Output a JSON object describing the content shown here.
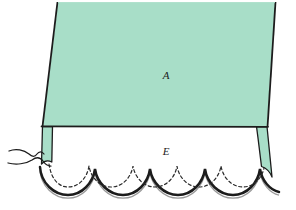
{
  "figure": {
    "background_color": "#ffffff",
    "panels": [
      {
        "id": "A",
        "label": "A",
        "name": "main-panel",
        "fill_color": "#a8dec8",
        "stroke_color": "#1c1c1c",
        "label_x": 166,
        "label_y": 75,
        "description": "Main fabric panel, mint green, trapezoid tapering downward"
      },
      {
        "id": "E",
        "label": "E",
        "name": "scalloped-facing-panel",
        "fill_color": "#ffffff",
        "stroke_color": "#1c1c1c",
        "label_x": 166,
        "label_y": 152,
        "description": "White scalloped hem facing below seam line"
      }
    ],
    "side_tabs": {
      "name": "side-seam-tabs",
      "fill_color": "#a8dec8",
      "count": 2,
      "description": "Green side seam allowance tabs extending below the seam line on left and right"
    },
    "seam_line": {
      "name": "horizontal-seam-line",
      "y": 126,
      "color": "#1c1c1c",
      "width": 1.6
    },
    "scallops": {
      "name": "scalloped-hem-edge",
      "count": 5,
      "outer_color": "#1c1c1c",
      "inner_color": "#9a9a9a",
      "outer_width": 2.4,
      "inner_width": 1.1
    },
    "stitch_line": {
      "name": "dashed-stitch-line",
      "color": "#2a2a2a",
      "style": "dashed",
      "dash_pattern": "3 2.6",
      "width": 1.2
    },
    "thread": {
      "name": "loose-thread",
      "color": "#1c1c1c",
      "width": 1.2,
      "description": "Loose thread squiggle at lower left near side tab"
    }
  },
  "colors": {
    "mint": "#a8dec8",
    "mint_shade": "#95d3bb",
    "ink": "#1c1c1c",
    "gray": "#9a9a9a",
    "white": "#ffffff"
  }
}
